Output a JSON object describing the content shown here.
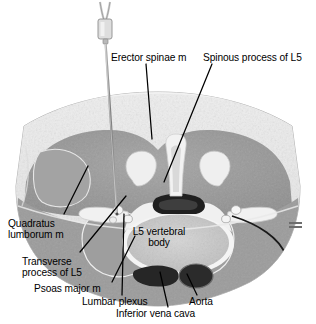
{
  "figure": {
    "kind": "axial-cross-section-anatomical-illustration",
    "region": "Lumbar spine at L5 level, axial (transverse) section",
    "style": "grayscale medical illustration",
    "procedure": "Posterior lumbar plexus block; needle advanced through erector spinae toward lumbar plexus",
    "signature_mark": "illegible artist signature mark"
  },
  "labels": [
    {
      "id": "erector-spinae",
      "text": "Erector spinae m",
      "x": 111,
      "y": 57,
      "align": "left"
    },
    {
      "id": "spinous-process-l5",
      "text": "Spinous process of L5",
      "x": 203,
      "y": 57,
      "align": "left"
    },
    {
      "id": "quadratus-lumborum",
      "text": "Quadratus\nlumborum m",
      "x": 8,
      "y": 220,
      "align": "left"
    },
    {
      "id": "transverse-process",
      "text": "Transverse\nprocess of L5",
      "x": 22,
      "y": 258,
      "align": "left"
    },
    {
      "id": "psoas-major",
      "text": "Psoas major m",
      "x": 34,
      "y": 287,
      "align": "left"
    },
    {
      "id": "lumbar-plexus",
      "text": "Lumbar plexus",
      "x": 82,
      "y": 300,
      "align": "left"
    },
    {
      "id": "inferior-vena-cava",
      "text": "Inferior vena cava",
      "x": 116,
      "y": 312,
      "align": "left"
    },
    {
      "id": "aorta",
      "text": "Aorta",
      "x": 189,
      "y": 300,
      "align": "left"
    },
    {
      "id": "l5-vertebral-body",
      "text": "L5 vertebral\nbody",
      "x": 150,
      "y": 228,
      "align": "center"
    }
  ],
  "leaders": [
    {
      "id": "leader-erector-spinae",
      "from": [
        146,
        62
      ],
      "to": [
        152,
        139
      ]
    },
    {
      "id": "leader-spinous-process",
      "from": [
        212,
        62
      ],
      "to": [
        163,
        181
      ]
    },
    {
      "id": "leader-quadratus-lumborum",
      "from": [
        62,
        214
      ],
      "to": [
        88,
        168
      ]
    },
    {
      "id": "leader-transverse-process",
      "from": [
        79,
        252
      ],
      "to": [
        125,
        196
      ]
    },
    {
      "id": "leader-psoas-major",
      "from": [
        111,
        281
      ],
      "to": [
        134,
        236
      ]
    },
    {
      "id": "leader-lumbar-plexus",
      "from": [
        121,
        294
      ],
      "to": [
        123,
        215
      ]
    },
    {
      "id": "leader-inferior-vena-cava",
      "from": [
        168,
        306
      ],
      "to": [
        160,
        272
      ]
    },
    {
      "id": "leader-aorta",
      "from": [
        196,
        294
      ],
      "to": [
        186,
        273
      ]
    }
  ],
  "needle": {
    "id": "block-needle",
    "hub_top": [
      105,
      3
    ],
    "tip": [
      117,
      214
    ],
    "description": "insulated block needle with hub and tubing entering skin and advancing to lumbar plexus"
  },
  "colors": {
    "background": "#ffffff",
    "text": "#000000",
    "leader_line": "#000000",
    "skin": "#c9c9c9",
    "subcutaneous_fat": "#e8e8e8",
    "muscle": "#9a9a9a",
    "bone_cortex": "#f0f0f0",
    "bone_marrow": "#bdbdbd",
    "vessel_lumen": "#2e2e2e",
    "spinal_canal": "#1c1c1c",
    "needle_shaft": "#8c8c8c"
  }
}
